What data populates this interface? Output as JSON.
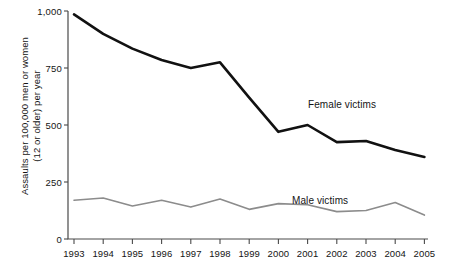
{
  "chart_data": {
    "type": "line",
    "title": "",
    "xlabel": "",
    "ylabel": "Assaults per 100,000 men or women\n(12 or older) per year",
    "x": [
      1993,
      1994,
      1995,
      1996,
      1997,
      1998,
      1999,
      2000,
      2001,
      2002,
      2003,
      2004,
      2005
    ],
    "xtick_labels": [
      "1993",
      "1994",
      "1995",
      "1996",
      "1997",
      "1998",
      "1999",
      "2000",
      "2001",
      "2002",
      "2003",
      "2004",
      "2005"
    ],
    "ytick_labels": [
      "0",
      "250",
      "500",
      "750",
      "1,000"
    ],
    "ytick_values": [
      0,
      250,
      500,
      750,
      1000
    ],
    "ylim": [
      0,
      1000
    ],
    "xlim": [
      1993,
      2005
    ],
    "grid": false,
    "legend_position": "inline-annotation",
    "series": [
      {
        "name": "Female victims",
        "color": "#111111",
        "width": 2.6,
        "values": [
          985,
          900,
          835,
          785,
          750,
          775,
          620,
          470,
          500,
          425,
          430,
          390,
          360
        ]
      },
      {
        "name": "Male victims",
        "color": "#8c8c8c",
        "width": 1.6,
        "values": [
          170,
          180,
          145,
          170,
          140,
          175,
          130,
          155,
          150,
          120,
          125,
          160,
          105
        ]
      }
    ],
    "annotations": [
      {
        "text": "Female victims",
        "x_px": 308,
        "y_px": 99
      },
      {
        "text": "Male victims",
        "x_px": 292,
        "y_px": 195
      }
    ]
  },
  "axes": {
    "plot_left_px": 68,
    "plot_right_px": 428,
    "plot_top_px": 11,
    "plot_bottom_px": 239,
    "first_tick_px": 74,
    "tick_spacing_px": 29.2
  }
}
